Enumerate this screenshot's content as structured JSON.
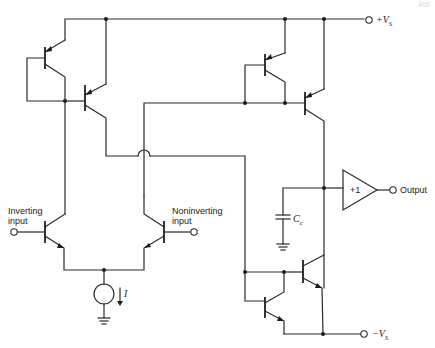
{
  "diagram": {
    "type": "circuit-schematic",
    "page_number": "405",
    "labels": {
      "pos_supply": "+V",
      "pos_supply_sub": "S",
      "neg_supply": "−V",
      "neg_supply_sub": "S",
      "inverting_line1": "Inverting",
      "inverting_line2": "input",
      "noninverting_line1": "Noninverting",
      "noninverting_line2": "input",
      "output": "Output",
      "buffer_gain": "+1",
      "cap": "C",
      "cap_sub": "c",
      "current": "I"
    },
    "components": [
      {
        "id": "Q1",
        "type": "PNP",
        "role": "diode-connected mirror (left)"
      },
      {
        "id": "Q2",
        "type": "PNP",
        "role": "mirror output (left)"
      },
      {
        "id": "Q3",
        "type": "PNP",
        "role": "diode-connected mirror (right)"
      },
      {
        "id": "Q4",
        "type": "PNP",
        "role": "mirror output (right)"
      },
      {
        "id": "Q5",
        "type": "NPN",
        "role": "inverting input transistor"
      },
      {
        "id": "Q6",
        "type": "NPN",
        "role": "noninverting input transistor"
      },
      {
        "id": "Q7",
        "type": "NPN",
        "role": "diode-connected mirror (bottom)"
      },
      {
        "id": "Q8",
        "type": "NPN",
        "role": "mirror output (bottom)"
      },
      {
        "id": "Cc",
        "type": "capacitor",
        "role": "compensation"
      },
      {
        "id": "I",
        "type": "current-source",
        "role": "tail current"
      },
      {
        "id": "Buf",
        "type": "buffer",
        "gain": "+1"
      }
    ]
  }
}
